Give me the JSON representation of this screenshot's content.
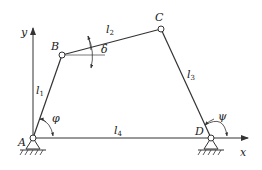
{
  "diagram": {
    "points": {
      "A": {
        "label": "A",
        "x": 33,
        "y": 138
      },
      "B": {
        "label": "B",
        "x": 62,
        "y": 55
      },
      "C": {
        "label": "C",
        "x": 161,
        "y": 29
      },
      "D": {
        "label": "D",
        "x": 211,
        "y": 138
      }
    },
    "links": [
      {
        "name": "l1",
        "main": "l",
        "sub": "1"
      },
      {
        "name": "l2",
        "main": "l",
        "sub": "2"
      },
      {
        "name": "l3",
        "main": "l",
        "sub": "3"
      },
      {
        "name": "l4",
        "main": "l",
        "sub": "4"
      }
    ],
    "angles": {
      "phi": "φ",
      "psi": "ψ",
      "delta": "δ"
    },
    "axes": {
      "x": "x",
      "y": "y"
    },
    "colors": {
      "line": "#333333",
      "background": "#ffffff"
    }
  }
}
